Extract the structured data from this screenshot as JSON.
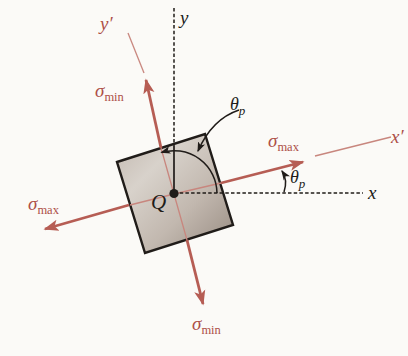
{
  "diagram": {
    "axes": {
      "x_label": "x",
      "y_label": "y",
      "x_prime_label": "x′",
      "y_prime_label": "y′"
    },
    "point_label": "Q",
    "sigma_max": {
      "base": "σ",
      "sub": "max"
    },
    "sigma_min": {
      "base": "σ",
      "sub": "min"
    },
    "theta_p": {
      "base": "θ",
      "sub": "p"
    },
    "colors": {
      "red_label": "#ad4f47",
      "red_thick": "#b65d54",
      "red_thin": "#c8867e",
      "ink": "#201c19",
      "square_light": "#d8d2cb",
      "square_mid": "#c2b8af",
      "square_dark": "#968a80",
      "background": "#fbfaf7"
    }
  }
}
